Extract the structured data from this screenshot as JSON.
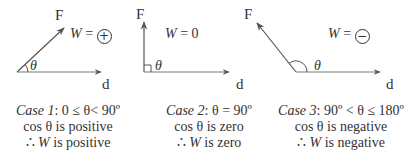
{
  "cases": [
    {
      "force_label": "F",
      "displacement_label": "d",
      "angle_symbol": "θ",
      "work_label": "W",
      "work_equals": "=",
      "work_sign": "+",
      "title_italic": "Case 1",
      "title_rest": ": 0 ≤ θ< 90º",
      "line2": "cos θ is positive",
      "line3_prefix": "∴ ",
      "line3_var": "W",
      "line3_rest": " is positive"
    },
    {
      "force_label": "F",
      "displacement_label": "d",
      "angle_symbol": "θ",
      "work_label": "W",
      "work_equals": "= 0",
      "title_italic": "Case 2",
      "title_rest": ": θ = 90º",
      "line2": "cos θ is zero",
      "line3_prefix": "∴ ",
      "line3_var": "W",
      "line3_rest": " is zero"
    },
    {
      "force_label": "F",
      "displacement_label": "d",
      "angle_symbol": "θ",
      "work_label": "W",
      "work_equals": "=",
      "work_sign": "−",
      "title_italic": "Case 3",
      "title_rest": ": 90º < θ ≤ 180º",
      "line2": "cos θ is negative",
      "line3_prefix": "∴ ",
      "line3_var": "W",
      "line3_rest": " is negative"
    }
  ],
  "colors": {
    "line": "#555555",
    "text": "#333333"
  }
}
